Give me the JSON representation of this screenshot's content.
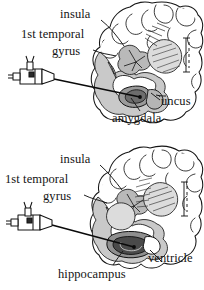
{
  "figure": {
    "type": "anatomical-illustration",
    "panel_count": 2,
    "ink_color": "#141414",
    "paper_color": "#ffffff",
    "tissue_fill": "#cfcfcf",
    "tissue_fill_light": "#e6e6e6"
  },
  "panel_top": {
    "name": "amygdala-target-section",
    "labels": [
      {
        "id": "insula",
        "text": "insula",
        "x": 60,
        "y": 10
      },
      {
        "id": "1st-temporal",
        "text": "1st temporal",
        "x": 22,
        "y": 30
      },
      {
        "id": "gyrus",
        "text": "gyrus",
        "x": 53,
        "y": 47
      },
      {
        "id": "uncus",
        "text": "uncus",
        "x": 161,
        "y": 97
      },
      {
        "id": "amygdala",
        "text": "amygdala",
        "x": 113,
        "y": 114
      }
    ],
    "device": {
      "name": "stereotactic-electrode-syringe",
      "x": 8,
      "y": 63
    }
  },
  "panel_bottom": {
    "name": "hippocampus-target-section",
    "labels": [
      {
        "id": "insula",
        "text": "insula",
        "x": 60,
        "y": 155
      },
      {
        "id": "1st-temporal",
        "text": "1st temporal",
        "x": 6,
        "y": 175
      },
      {
        "id": "gyrus",
        "text": "gyrus",
        "x": 44,
        "y": 192
      },
      {
        "id": "ventricle",
        "text": "ventricle",
        "x": 148,
        "y": 252
      },
      {
        "id": "hippocampus",
        "text": "hippocampus",
        "x": 59,
        "y": 268
      }
    ],
    "device": {
      "name": "stereotactic-electrode-syringe",
      "x": 6,
      "y": 208
    }
  }
}
